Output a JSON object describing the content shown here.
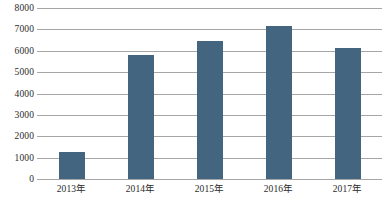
{
  "chart_data": {
    "type": "bar",
    "title": "",
    "subtitle": "",
    "xlabel": "",
    "ylabel": "",
    "categories": [
      "2013年",
      "2014年",
      "2015年",
      "2016年",
      "2017年"
    ],
    "values": [
      1250,
      5800,
      6450,
      7150,
      6150
    ],
    "series": [
      {
        "name": "",
        "values": [
          1250,
          5800,
          6450,
          7150,
          6150
        ]
      }
    ],
    "ylim": [
      0,
      8000
    ],
    "y_ticks": [
      0,
      1000,
      2000,
      3000,
      4000,
      5000,
      6000,
      7000,
      8000
    ],
    "y_tick_labels": [
      "0",
      "1000",
      "2000",
      "3000",
      "4000",
      "5000",
      "6000",
      "7000",
      "8000"
    ],
    "grid": true,
    "grid_axis": "y",
    "legend": false,
    "legend_position": "none",
    "bar_color": "#44657f",
    "gridline_color": "#a6a6a6",
    "background_color": "#ffffff",
    "text_color": "#2b2b2b"
  }
}
